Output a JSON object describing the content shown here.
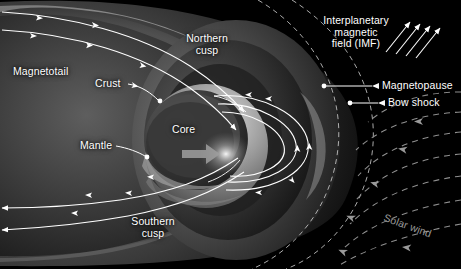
{
  "figure": {
    "background_color": "#000000",
    "label_color": "#ffffff",
    "solar_wind_color": "#9a9a9a",
    "field_line_color": "#ffffff",
    "width": 461,
    "height": 275
  },
  "labels": {
    "magnetotail": "Magnetotail",
    "northern_cusp_line1": "Northern",
    "northern_cusp_line2": "cusp",
    "southern_cusp_line1": "Southern",
    "southern_cusp_line2": "cusp",
    "crust": "Crust",
    "mantle": "Mantle",
    "core": "Core",
    "imf_line1": "Interplanetary",
    "imf_line2": "magnetic",
    "imf_line3": "field (IMF)",
    "magnetopause": "Magnetopause",
    "bow_shock": "Bow shock",
    "solar_wind": "Solar wind"
  },
  "annotations": {
    "leader_lines": [
      {
        "name": "crust-leader",
        "from_label": "Crust",
        "dot_x": 160,
        "dot_y": 101
      },
      {
        "name": "mantle-leader",
        "from_label": "Mantle",
        "dot_x": 147,
        "dot_y": 157
      },
      {
        "name": "magnetopause-leader",
        "from_label": "Magnetopause",
        "dot_x": 324,
        "dot_y": 86
      },
      {
        "name": "bow-shock-leader",
        "from_label": "Bow shock",
        "dot_x": 350,
        "dot_y": 103
      }
    ],
    "imf_arrows": {
      "count": 4,
      "direction": "up-right"
    },
    "solar_wind_streamlines": {
      "style": "dashed",
      "arrow_direction": "left",
      "count": 7
    }
  }
}
